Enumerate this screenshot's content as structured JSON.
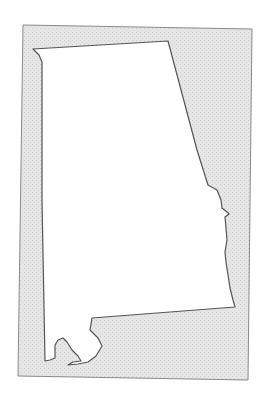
{
  "map": {
    "title": "Alabama",
    "region_name": "Alabama",
    "colors": {
      "background": "#ffffff",
      "frame_fill": "#e4e4e4",
      "frame_stroke": "#8a8a8a",
      "state_fill": "#ffffff",
      "state_stroke": "#555555"
    }
  }
}
